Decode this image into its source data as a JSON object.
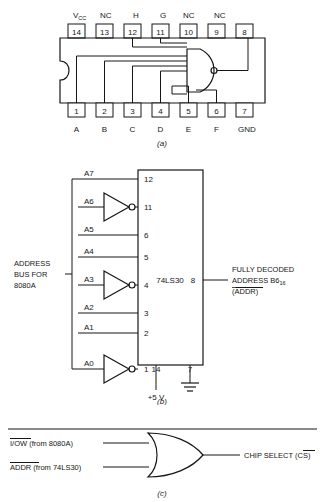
{
  "figure": {
    "caption_a": "(a)",
    "caption_b": "(b)",
    "caption_c": "(c)"
  },
  "dip_package": {
    "part": "74LS30",
    "top_pin_numbers": [
      "14",
      "13",
      "12",
      "11",
      "10",
      "9",
      "8"
    ],
    "top_pin_labels": [
      "V",
      "NC",
      "H",
      "G",
      "NC",
      "NC",
      ""
    ],
    "vcc_main": "V",
    "vcc_sub": "CC",
    "bottom_pin_numbers": [
      "1",
      "2",
      "3",
      "4",
      "5",
      "6",
      "7"
    ],
    "bottom_pin_labels": [
      "A",
      "B",
      "C",
      "D",
      "E",
      "F",
      "GND"
    ],
    "gate_type": "8-input-nand"
  },
  "logic_diagram": {
    "chip_label": "74LS30",
    "bus_label_line1": "ADDRESS",
    "bus_label_line2": "BUS FOR",
    "bus_label_line3": "8080A",
    "address_lines": [
      {
        "name": "A7",
        "pin": "12",
        "inverted": false
      },
      {
        "name": "A6",
        "pin": "11",
        "inverted": true
      },
      {
        "name": "A5",
        "pin": "6",
        "inverted": false
      },
      {
        "name": "A4",
        "pin": "5",
        "inverted": false
      },
      {
        "name": "A3",
        "pin": "4",
        "inverted": true
      },
      {
        "name": "A2",
        "pin": "3",
        "inverted": false
      },
      {
        "name": "A1",
        "pin": "2",
        "inverted": false
      },
      {
        "name": "A0",
        "pin": "1",
        "inverted": true
      }
    ],
    "output_pin": "8",
    "output_label_line1": "FULLY DECODED",
    "output_label_line2_main": "ADDRESS B6",
    "output_label_line2_sub": "16",
    "output_label_line3": "(ADDR)",
    "power_pin": "14",
    "power_label": "+5 V",
    "ground_pin": "7"
  },
  "chip_select": {
    "input1_bar": "I/OW",
    "input1_rest": " (from 8080A)",
    "input2_bar": "ADDR",
    "input2_rest": " (from 74LS30)",
    "output_prefix": "CHIP SELECT (",
    "output_bar": "CS",
    "output_suffix": ")",
    "gate_type": "or"
  }
}
